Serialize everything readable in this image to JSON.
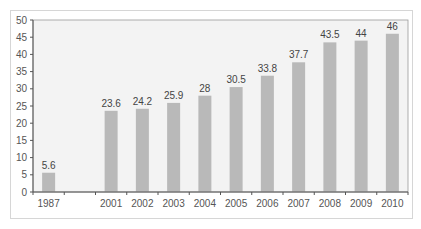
{
  "chart_data": {
    "type": "bar",
    "title": "",
    "xlabel": "",
    "ylabel": "",
    "categories": [
      "1987",
      "",
      "2001",
      "2002",
      "2003",
      "2004",
      "2005",
      "2006",
      "2007",
      "2008",
      "2009",
      "2010"
    ],
    "values": [
      5.6,
      null,
      23.6,
      24.2,
      25.9,
      28,
      30.5,
      33.8,
      37.7,
      43.5,
      44,
      46
    ],
    "data_labels": [
      "5.6",
      "",
      "23.6",
      "24.2",
      "25.9",
      "28",
      "30.5",
      "33.8",
      "37.7",
      "43.5",
      "44",
      "46"
    ],
    "ylim": [
      0,
      50
    ],
    "yticks": [
      0,
      5,
      10,
      15,
      20,
      25,
      30,
      35,
      40,
      45,
      50
    ],
    "grid": false,
    "legend": "none",
    "colors": {
      "bar": "#b9b9b9",
      "plot_bg": "#f3f3f3",
      "axis": "#555555",
      "frame": "#d6d6d6"
    }
  }
}
